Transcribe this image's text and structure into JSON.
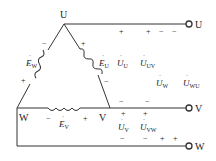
{
  "diagram": {
    "type": "delta-connected three-phase source",
    "nodes": {
      "top": "U",
      "left": "W",
      "right": "V"
    },
    "terminals": {
      "u": "U",
      "v": "V",
      "w": "W"
    },
    "sources": {
      "ew": {
        "symbol": "E",
        "sub": "W",
        "plus": "+",
        "minus": "−"
      },
      "eu": {
        "symbol": "E",
        "sub": "U",
        "plus": "+",
        "minus": "−"
      },
      "ev": {
        "symbol": "E",
        "sub": "V",
        "plus": "+",
        "minus": "−"
      }
    },
    "voltages": {
      "uu": {
        "symbol": "U",
        "sub": "U"
      },
      "uuv": {
        "symbol": "U",
        "sub": "UV"
      },
      "uw": {
        "symbol": "U",
        "sub": "W"
      },
      "uwu": {
        "symbol": "U",
        "sub": "WU"
      },
      "uv": {
        "symbol": "U",
        "sub": "V"
      },
      "uvw": {
        "symbol": "U",
        "sub": "VW"
      }
    },
    "signs": {
      "plus": "+",
      "minus": "−"
    },
    "colors": {
      "line": "#333333",
      "text": "#222222",
      "background": "#ffffff"
    }
  }
}
